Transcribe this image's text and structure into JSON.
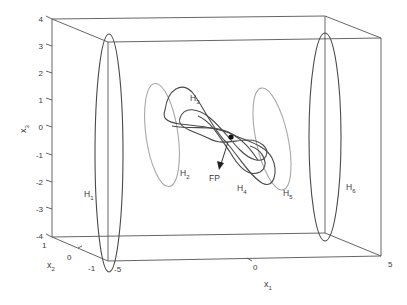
{
  "figure": {
    "type": "3d-phase-space-diagram",
    "axes": {
      "x1": {
        "label": "x",
        "subscript": "1",
        "ticks": [
          "-5",
          "0",
          "5"
        ],
        "range": [
          -5,
          5
        ]
      },
      "x2": {
        "label": "x",
        "subscript": "2",
        "ticks": [
          "1",
          "0",
          "-1"
        ],
        "range": [
          -1,
          1
        ]
      },
      "x3": {
        "label": "x",
        "subscript": "3",
        "ticks": [
          "4",
          "3",
          "2",
          "1",
          "0",
          "-1",
          "-2",
          "-3",
          "-4"
        ],
        "range": [
          -4,
          4
        ]
      }
    },
    "curves": [
      {
        "id": "H1",
        "label": "H",
        "subscript": "1",
        "shade": "dark",
        "shape": "ellipse"
      },
      {
        "id": "H2",
        "label": "H",
        "subscript": "2",
        "shade": "light",
        "shape": "ellipse"
      },
      {
        "id": "H3",
        "label": "H",
        "subscript": "3",
        "shade": "dark",
        "shape": "figure-eight loop"
      },
      {
        "id": "H4",
        "label": "H",
        "subscript": "4",
        "shade": "dark",
        "shape": "figure-eight loop"
      },
      {
        "id": "H5",
        "label": "H",
        "subscript": "5",
        "shade": "light",
        "shape": "ellipse"
      },
      {
        "id": "H6",
        "label": "H",
        "subscript": "6",
        "shade": "dark",
        "shape": "ellipse"
      }
    ],
    "fixed_point": {
      "label": "FP",
      "marker": "filled-dot",
      "arrow": true
    },
    "colors": {
      "dark_curve": "#4a4a4a",
      "light_curve": "#a8a8a8",
      "box": "#555555",
      "text": "#3a3a3a"
    }
  }
}
